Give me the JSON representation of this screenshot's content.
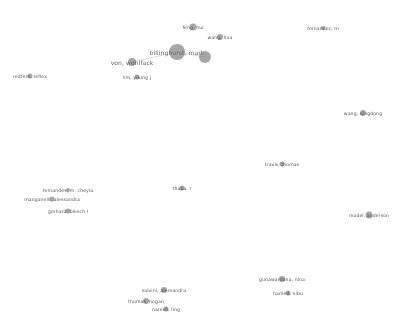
{
  "network": {
    "type": "co-authorship-map",
    "nodes": [
      {
        "label": "feng, hui",
        "x": 193,
        "y": 27,
        "r": 3.5,
        "big": false
      },
      {
        "label": "wang, hua",
        "x": 220,
        "y": 37,
        "r": 3,
        "big": false
      },
      {
        "label": "billinghurst, mark",
        "x": 177,
        "y": 52,
        "r": 8,
        "big": true
      },
      {
        "label": "",
        "x": 205,
        "y": 57,
        "r": 6,
        "big": false
      },
      {
        "label": "von, wohlfack",
        "x": 132,
        "y": 62,
        "r": 4,
        "big": true
      },
      {
        "label": "lim, young j",
        "x": 137,
        "y": 77,
        "r": 2.5,
        "big": false
      },
      {
        "label": "redfern, reflex",
        "x": 30,
        "y": 76,
        "r": 2.5,
        "big": false
      },
      {
        "label": "fernandez, m",
        "x": 323,
        "y": 28,
        "r": 2,
        "big": false
      },
      {
        "label": "wang, qingdong",
        "x": 363,
        "y": 113,
        "r": 3,
        "big": false
      },
      {
        "label": "travis, thomas",
        "x": 282,
        "y": 164,
        "r": 2.5,
        "big": false
      },
      {
        "label": "thapa, r",
        "x": 182,
        "y": 188,
        "r": 2.5,
        "big": false
      },
      {
        "label": "fernandes, m. cheyla",
        "x": 68,
        "y": 190,
        "r": 2,
        "big": false
      },
      {
        "label": "manganelli, alessandra",
        "x": 52,
        "y": 199,
        "r": 2.5,
        "big": false
      },
      {
        "label": "gerhard, blesch l",
        "x": 68,
        "y": 211,
        "r": 2.5,
        "big": false
      },
      {
        "label": "madel, anderson",
        "x": 369,
        "y": 215,
        "r": 3.5,
        "big": false
      },
      {
        "label": "gunawardana, nina",
        "x": 282,
        "y": 279,
        "r": 3,
        "big": false
      },
      {
        "label": "hamed, nibu",
        "x": 288,
        "y": 293,
        "r": 2.5,
        "big": false
      },
      {
        "label": "salvini, alessandra",
        "x": 164,
        "y": 290,
        "r": 3,
        "big": false
      },
      {
        "label": "thomas, hogan",
        "x": 146,
        "y": 301,
        "r": 3,
        "big": false
      },
      {
        "label": "naresh, ling",
        "x": 166,
        "y": 309,
        "r": 2.5,
        "big": false
      }
    ],
    "edges": [
      {
        "from": 2,
        "to": 3
      },
      {
        "from": 2,
        "to": 4
      }
    ],
    "colors": {
      "node": "#8a8a8a",
      "label": "#555555",
      "edge": "#d0d0d0",
      "background": "#ffffff"
    }
  }
}
